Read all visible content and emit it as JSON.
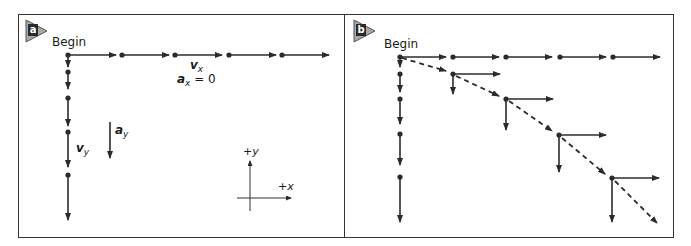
{
  "panels": {
    "a": {
      "badge": "a",
      "begin_label": "Begin",
      "vx_label": "v",
      "vx_sub": "x",
      "ax_label": "a",
      "ax_sub": "x",
      "ax_value": " = 0",
      "vy_label": "v",
      "vy_sub": "y",
      "ay_label": "a",
      "ay_sub": "y",
      "axes": {
        "y_label": "+y",
        "x_label": "+x"
      }
    },
    "b": {
      "badge": "b",
      "begin_label": "Begin"
    }
  },
  "colors": {
    "arrow": "#2b2b2b",
    "border": "#333333",
    "badge_fill": "#a8a8a8",
    "badge_edge": "#555555"
  },
  "geometry": {
    "horizontal_dots_a": [
      68,
      122,
      174,
      228,
      282
    ],
    "vertical_dots_a": [
      55,
      72,
      98,
      132,
      175
    ],
    "vertical_tips_a": [
      66,
      88,
      126,
      167,
      220
    ],
    "trajectory_points_b": [
      [
        400,
        57
      ],
      [
        453,
        74
      ],
      [
        506,
        99
      ],
      [
        559,
        135
      ],
      [
        612,
        178
      ],
      [
        658,
        224
      ]
    ]
  }
}
